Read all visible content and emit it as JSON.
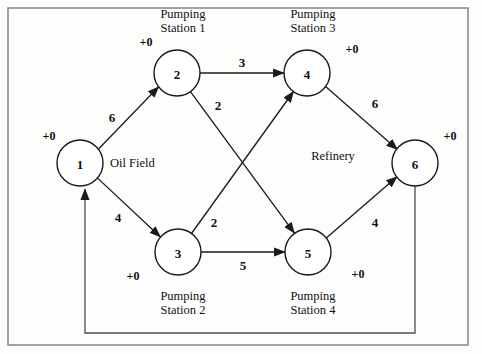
{
  "diagram": {
    "type": "directed-flow-network",
    "frame": {
      "x": 8,
      "y": 8,
      "width": 460,
      "height": 337
    },
    "nodes": [
      {
        "id": "1",
        "label": "1",
        "name": "Oil Field",
        "name_position": "right",
        "supply": "+0",
        "supply_position": "upper-left",
        "cx": 80,
        "cy": 163,
        "r": 23
      },
      {
        "id": "2",
        "label": "2",
        "name": "Pumping\nStation 1",
        "name_line1": "Pumping",
        "name_line2": "Station 1",
        "name_position": "above",
        "supply": "+0",
        "supply_position": "left",
        "cx": 177,
        "cy": 73,
        "r": 23
      },
      {
        "id": "3",
        "label": "3",
        "name_line1": "Pumping",
        "name_line2": "Station 2",
        "name_position": "below",
        "supply": "+0",
        "supply_position": "left",
        "cx": 178,
        "cy": 252,
        "r": 23
      },
      {
        "id": "4",
        "label": "4",
        "name_line1": "Pumping",
        "name_line2": "Station 3",
        "name_position": "above",
        "supply": "+0",
        "supply_position": "right",
        "cx": 307,
        "cy": 73,
        "r": 23
      },
      {
        "id": "5",
        "label": "5",
        "name_line1": "Pumping",
        "name_line2": "Station 4",
        "name_position": "below",
        "supply": "+0",
        "supply_position": "right",
        "cx": 308,
        "cy": 252,
        "r": 23
      },
      {
        "id": "6",
        "label": "6",
        "name": "Refinery",
        "name_position": "left",
        "supply": "+0",
        "supply_position": "upper-right",
        "cx": 415,
        "cy": 163,
        "r": 23
      }
    ],
    "edges": [
      {
        "from": "1",
        "to": "2",
        "weight": "6",
        "label_x": 112,
        "label_y": 117
      },
      {
        "from": "1",
        "to": "3",
        "weight": "4",
        "label_x": 118,
        "label_y": 217
      },
      {
        "from": "2",
        "to": "4",
        "weight": "3",
        "label_x": 242,
        "label_y": 62
      },
      {
        "from": "2",
        "to": "5",
        "weight": "2",
        "label_x": 218,
        "label_y": 105
      },
      {
        "from": "3",
        "to": "4",
        "weight": "2",
        "label_x": 214,
        "label_y": 222
      },
      {
        "from": "3",
        "to": "5",
        "weight": "5",
        "label_x": 243,
        "label_y": 265
      },
      {
        "from": "4",
        "to": "6",
        "weight": "6",
        "label_x": 375,
        "label_y": 103
      },
      {
        "from": "5",
        "to": "6",
        "weight": "4",
        "label_x": 375,
        "label_y": 222
      },
      {
        "from": "6",
        "to": "1",
        "weight": "",
        "routing": "orthogonal-bottom"
      }
    ],
    "labels": {
      "oil_field": "Oil Field",
      "refinery": "Refinery",
      "pumping": "Pumping",
      "station1": "Station 1",
      "station2": "Station 2",
      "station3": "Station 3",
      "station4": "Station 4",
      "zero_supply": "+0"
    },
    "colors": {
      "stroke": "#1a1a1a",
      "frame": "#8d8d8d",
      "feedback": "#4d4d4d",
      "background": "#fdfdfc",
      "text": "#111111"
    }
  }
}
